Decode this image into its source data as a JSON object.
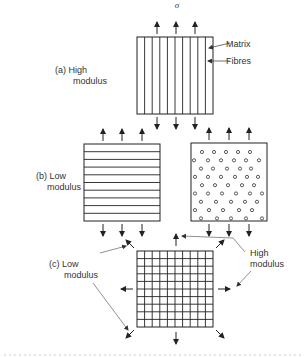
{
  "diagram": {
    "stress_symbol": "σ",
    "panel_a": {
      "label_line1": "(a)  High",
      "label_line2": "modulus",
      "callouts": [
        "Matrix",
        "Fibres"
      ],
      "fibre_orientation": "vertical (parallel to load)",
      "fibre_count": 10
    },
    "panel_b": {
      "label_line1": "(b)  Low",
      "label_line2": "modulus",
      "left_fibre_orientation": "horizontal (perpendicular to load)",
      "left_fibre_count": 10,
      "right_fibre_orientation": "end-on (circular cross-sections)"
    },
    "panel_c": {
      "label_line1": "(c)  Low",
      "label_line2": "modulus",
      "right_label_line1": "High",
      "right_label_line2": "modulus",
      "grid_columns": 10,
      "grid_rows": 10
    }
  }
}
